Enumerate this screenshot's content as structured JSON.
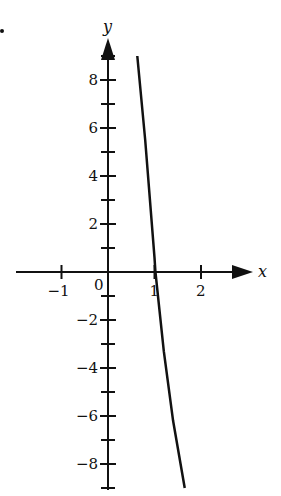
{
  "chart_data": {
    "type": "line",
    "title": "",
    "xlabel": "x",
    "ylabel": "y",
    "xlim": [
      -1.8,
      2.8
    ],
    "ylim": [
      -9,
      9.5
    ],
    "grid": false,
    "x_ticks": [
      -1,
      0,
      1,
      2
    ],
    "x_tick_labels": [
      "−1",
      "0",
      "1",
      "2"
    ],
    "y_ticks_labeled": [
      8,
      6,
      4,
      2,
      -2,
      -4,
      -6,
      -8
    ],
    "y_tick_labels": [
      "8",
      "6",
      "4",
      "2",
      "−2",
      "−4",
      "−6",
      "−8"
    ],
    "y_minor_ticks": [
      9,
      7,
      5,
      3,
      1,
      -1,
      -3,
      -5,
      -7,
      -9
    ],
    "series": [
      {
        "name": "curve",
        "x": [
          0.63,
          0.8,
          1.0,
          1.02,
          1.2,
          1.4,
          1.65
        ],
        "y": [
          9.0,
          5.5,
          0.6,
          0.0,
          -3.3,
          -6.2,
          -9.0
        ]
      }
    ],
    "origin_label": "0",
    "legend": null
  },
  "colors": {
    "ink": "#111111",
    "background": "#ffffff"
  }
}
